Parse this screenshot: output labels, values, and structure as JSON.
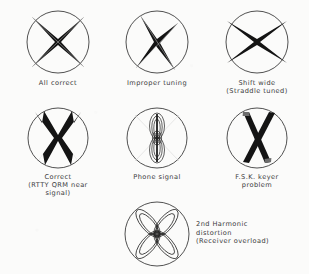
{
  "figure": {
    "background_color": "#fbfbfa",
    "ink_color": "#1a1a1a",
    "circle_stroke_color": "#3d3d3d"
  },
  "patterns": [
    {
      "id": "all-correct",
      "caption": "All correct",
      "pattern": "crossed-ellipse-x",
      "row": 1,
      "column": 1
    },
    {
      "id": "improper-tuning",
      "caption": "Improper tuning",
      "pattern": "skewed-x",
      "row": 1,
      "column": 2
    },
    {
      "id": "shift-wide",
      "caption": "Shift wide\n(Straddle tuned)",
      "pattern": "wide-x",
      "row": 1,
      "column": 3
    },
    {
      "id": "correct-rtty-qrm",
      "caption": "Correct\n(RTTY QRM near\nsignal)",
      "pattern": "split-tip-x",
      "row": 2,
      "column": 1
    },
    {
      "id": "phone-signal",
      "caption": "Phone signal",
      "pattern": "vertical-nested-ellipses",
      "row": 2,
      "column": 2
    },
    {
      "id": "fsk-keyer-problem",
      "caption": "F.S.K. keyer\nproblem",
      "pattern": "narrow-crossed-bars",
      "row": 2,
      "column": 3
    },
    {
      "id": "second-harmonic-distortion",
      "caption": "2nd Harmonic\n   distortion\n(Receiver overload)",
      "pattern": "four-petal-clover",
      "row": 3,
      "column": 2
    }
  ]
}
